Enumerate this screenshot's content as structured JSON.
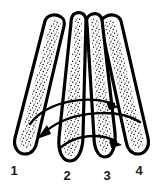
{
  "figure": {
    "background_color": "#ffffff",
    "ink_color": "#000000",
    "label_color": "#1a1a1a",
    "width": 162,
    "height": 193
  },
  "fingers": [
    {
      "id": "finger-1",
      "label": "1",
      "label_x": 14,
      "label_y": 168,
      "tip_top_x": 60,
      "tip_top_y": 16,
      "tip_bottom_x": 20,
      "tip_bottom_y": 150,
      "orientation": "splayed-left",
      "texture": "stipple"
    },
    {
      "id": "finger-2",
      "label": "2",
      "label_x": 67,
      "label_y": 172,
      "tip_top_x": 75,
      "tip_top_y": 14,
      "tip_bottom_x": 70,
      "tip_bottom_y": 160,
      "orientation": "near-vertical",
      "texture": "stipple"
    },
    {
      "id": "finger-3",
      "label": "3",
      "label_x": 107,
      "label_y": 172,
      "tip_top_x": 92,
      "tip_top_y": 14,
      "tip_bottom_x": 106,
      "tip_bottom_y": 157,
      "orientation": "near-vertical",
      "texture": "stipple"
    },
    {
      "id": "finger-4",
      "label": "4",
      "label_x": 139,
      "label_y": 168,
      "tip_top_x": 106,
      "tip_top_y": 16,
      "tip_bottom_x": 140,
      "tip_bottom_y": 150,
      "orientation": "splayed-right",
      "texture": "stipple"
    }
  ],
  "arrows": [
    {
      "id": "arrow-upper-rightward",
      "direction": "rightward",
      "start_x": 30,
      "start_y": 122,
      "end_x": 116,
      "end_y": 104,
      "head_angle_deg": 25,
      "description": "upper sweeping arc from finger 1 side toward finger 4 side, head pointing right"
    },
    {
      "id": "arrow-middle-leftward",
      "direction": "leftward",
      "start_x": 136,
      "start_y": 118,
      "end_x": 40,
      "end_y": 136,
      "head_angle_deg": 205,
      "description": "middle sweeping arc from finger 4 side toward finger 1 side, head pointing left"
    },
    {
      "id": "arrow-lower-rightward",
      "direction": "rightward",
      "start_x": 62,
      "start_y": 146,
      "end_x": 122,
      "end_y": 140,
      "head_angle_deg": 20,
      "description": "lower short arc under fingers 2-3 toward finger 4, head pointing right"
    }
  ]
}
